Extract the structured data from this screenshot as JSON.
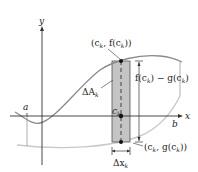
{
  "diagram": {
    "axes": {
      "x_label": "x",
      "y_label": "y"
    },
    "labels": {
      "a": "a",
      "b": "b",
      "ck": "c",
      "ck_sub": "k",
      "delta_a": "ΔA",
      "delta_a_sub": "k",
      "delta_x": "Δx",
      "delta_x_sub": "k",
      "top_point": "(c",
      "top_point_sub": "k",
      "top_point_rest": ", f(c",
      "top_point_sub2": "k",
      "top_point_end": "))",
      "height": "f(c",
      "height_sub": "k",
      "height_mid": ") − g(c",
      "height_sub2": "k",
      "height_end": ")",
      "bottom_point": "(c",
      "bottom_point_sub": "k",
      "bottom_point_rest": ", g(c",
      "bottom_point_sub2": "k",
      "bottom_point_end": "))"
    },
    "colors": {
      "f_curve": "#8a8a8a",
      "g_curve": "#c8c8c8",
      "rectangle_fill": "#c4c4c4",
      "axis": "#333333"
    }
  }
}
